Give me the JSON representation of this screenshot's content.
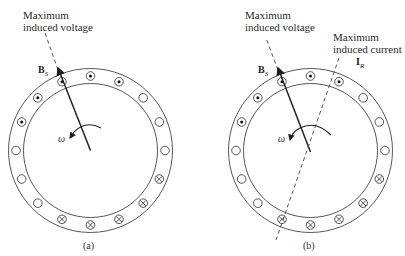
{
  "figure": {
    "slot_count": 16,
    "slot_angle_step_deg": 22.5,
    "slot_pattern_clockwise_from_top": [
      "dot",
      "dot",
      "empty",
      "empty",
      "empty",
      "cross",
      "cross",
      "cross",
      "cross",
      "cross",
      "empty",
      "empty",
      "empty",
      "dot",
      "dot",
      "dot"
    ],
    "colors": {
      "line": "#333333",
      "background": "#ffffff"
    }
  },
  "panel_a": {
    "caption": "(a)",
    "label_voltage_line1": "Maximum",
    "label_voltage_line2": "induced voltage",
    "bs_symbol": "B",
    "bs_subscript": "S",
    "omega": "ω"
  },
  "panel_b": {
    "caption": "(b)",
    "label_voltage_line1": "Maximum",
    "label_voltage_line2": "induced voltage",
    "label_current_line1": "Maximum",
    "label_current_line2": "induced current",
    "ir_symbol": "I",
    "ir_subscript": "R",
    "bs_symbol": "B",
    "bs_subscript": "S",
    "omega": "ω"
  }
}
